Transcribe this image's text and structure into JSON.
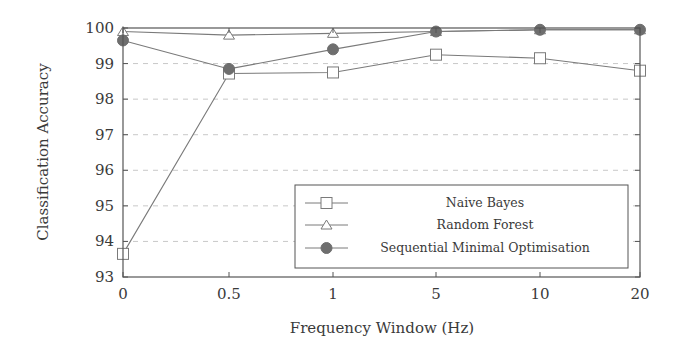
{
  "chart_data": {
    "type": "line",
    "title": "",
    "xlabel": "Frequency Window (Hz)",
    "ylabel": "Classification Accuracy",
    "categories": [
      "0",
      "0.5",
      "1",
      "5",
      "10",
      "20"
    ],
    "ylim": [
      93,
      100
    ],
    "yticks": [
      93,
      94,
      95,
      96,
      97,
      98,
      99,
      100
    ],
    "grid": "horizontal dashed",
    "legend_position": "lower right inside",
    "series": [
      {
        "name": "Naive Bayes",
        "marker": "square-open",
        "values": [
          93.65,
          98.72,
          98.75,
          99.25,
          99.15,
          98.8
        ]
      },
      {
        "name": "Random Forest",
        "marker": "triangle-open",
        "values": [
          99.9,
          99.8,
          99.85,
          99.9,
          99.95,
          99.95
        ]
      },
      {
        "name": "Sequential Minimal Optimisation",
        "marker": "circle-filled",
        "values": [
          99.65,
          98.85,
          99.4,
          99.9,
          99.95,
          99.95
        ]
      }
    ]
  },
  "colors": {
    "line": "#7a7a7a",
    "axis": "#555555",
    "grid": "#c8c8c8",
    "marker_fill": "#6e6e6e"
  }
}
